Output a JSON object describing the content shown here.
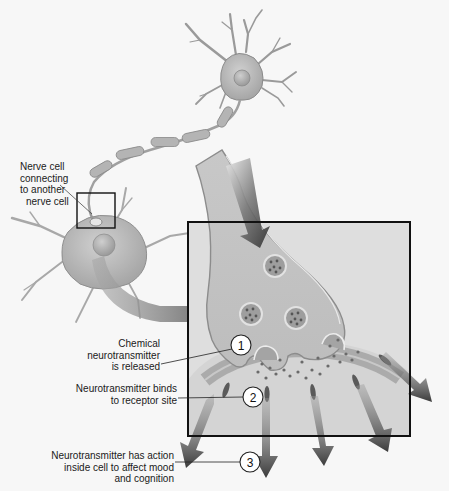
{
  "diagram": {
    "type": "neuron-synapse-illustration",
    "colors": {
      "background": "#f7f7f7",
      "cell_fill": "#b9b9b9",
      "cell_light": "#d6d6d6",
      "cell_edge": "#8a8a8a",
      "arrow_dark": "#3a3a3a",
      "frame": "#111111",
      "box_fill": "#d2d2d2"
    },
    "labels": {
      "connection": [
        "Nerve cell",
        "connecting",
        "to another",
        "nerve cell"
      ],
      "step1": [
        "Chemical",
        "neurotransmitter",
        "is released"
      ],
      "step2": [
        "Neurotransmitter binds",
        "to receptor site"
      ],
      "step3": [
        "Neurotransmitter has action",
        "inside cell to affect mood",
        "and cognition"
      ]
    },
    "callouts": [
      {
        "number": "1"
      },
      {
        "number": "2"
      },
      {
        "number": "3"
      }
    ]
  }
}
